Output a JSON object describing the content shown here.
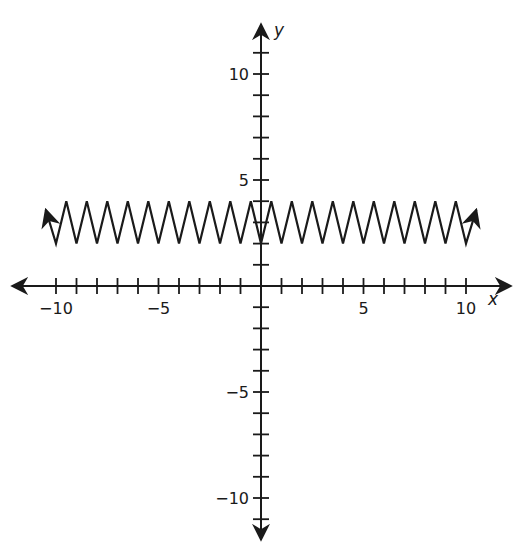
{
  "chart_data": {
    "type": "line",
    "title": "",
    "xlabel": "x",
    "ylabel": "y",
    "xlim": [
      -10.5,
      10.5
    ],
    "ylim": [
      -12,
      12
    ],
    "grid": false,
    "legend": null,
    "x_ticks": [
      -10,
      -9,
      -8,
      -7,
      -6,
      -5,
      -4,
      -3,
      -2,
      -1,
      1,
      2,
      3,
      4,
      5,
      6,
      7,
      8,
      9,
      10
    ],
    "y_ticks": [
      -11,
      -10,
      -9,
      -8,
      -7,
      -6,
      -5,
      -4,
      -3,
      -2,
      -1,
      1,
      2,
      3,
      4,
      5,
      6,
      7,
      8,
      9,
      10,
      11
    ],
    "x_tick_labels": [
      {
        "value": -10,
        "label": "−10"
      },
      {
        "value": -5,
        "label": "−5"
      },
      {
        "value": 5,
        "label": "5"
      },
      {
        "value": 10,
        "label": "10"
      }
    ],
    "y_tick_labels": [
      {
        "value": 10,
        "label": "10"
      },
      {
        "value": 5,
        "label": "5"
      },
      {
        "value": -5,
        "label": "−5"
      },
      {
        "value": -10,
        "label": "−10"
      }
    ],
    "series": [
      {
        "name": "zigzag (triangle wave)",
        "description": "Periodic zigzag between y=2 (valleys at integer x) and y=4 (peaks at half-integer x), arrows at both ends",
        "min": 2,
        "max": 4,
        "period": 1,
        "x": [
          -10.5,
          -10,
          -9.5,
          -9,
          -8.5,
          -8,
          -7.5,
          -7,
          -6.5,
          -6,
          -5.5,
          -5,
          -4.5,
          -4,
          -3.5,
          -3,
          -2.5,
          -2,
          -1.5,
          -1,
          -0.5,
          0,
          0.5,
          1,
          1.5,
          2,
          2.5,
          3,
          3.5,
          4,
          4.5,
          5,
          5.5,
          6,
          6.5,
          7,
          7.5,
          8,
          8.5,
          9,
          9.5,
          10,
          10.5
        ],
        "y": [
          3.6,
          2,
          4,
          2,
          4,
          2,
          4,
          2,
          4,
          2,
          4,
          2,
          4,
          2,
          4,
          2,
          4,
          2,
          4,
          2,
          4,
          2,
          4,
          2,
          4,
          2,
          4,
          2,
          4,
          2,
          4,
          2,
          4,
          2,
          4,
          2,
          4,
          2,
          4,
          2,
          4,
          2,
          3.6
        ],
        "arrows": [
          "left",
          "right"
        ]
      }
    ]
  },
  "axes": {
    "x_name": "x",
    "y_name": "y"
  }
}
